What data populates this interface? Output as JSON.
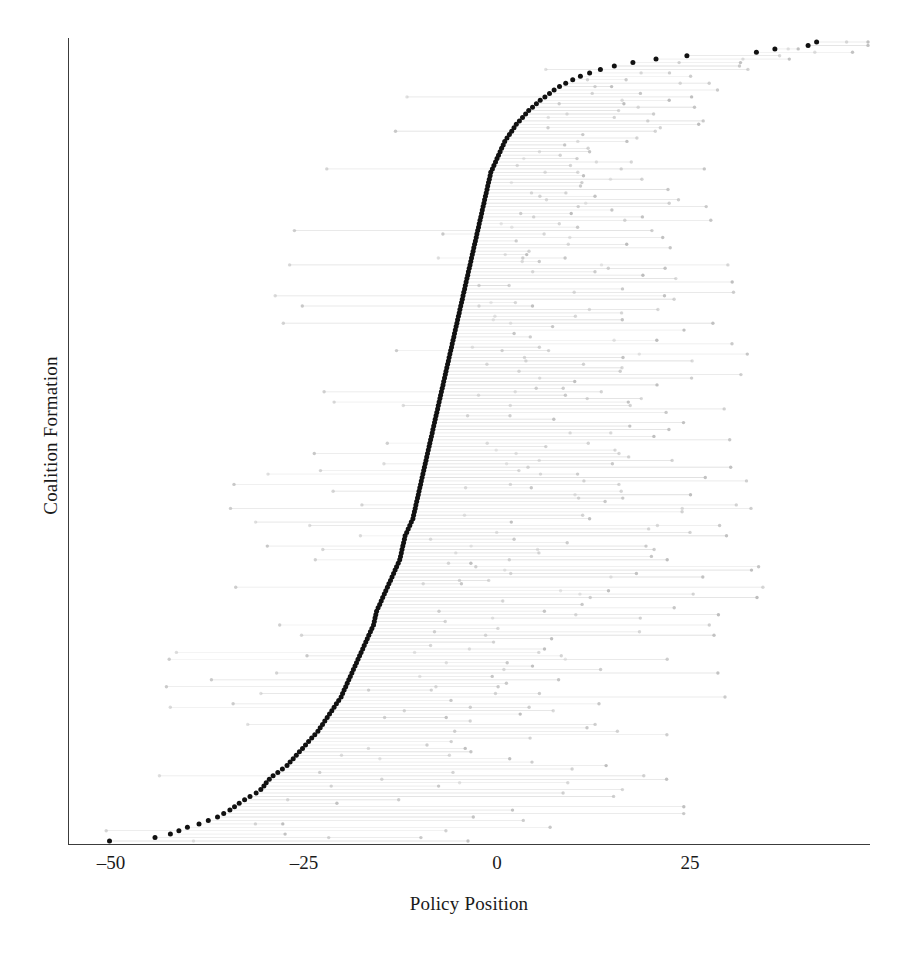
{
  "chart_data": {
    "type": "scatter",
    "title": "",
    "subtitle": "",
    "xlabel": "Policy Position",
    "ylabel": "Coalition Formation",
    "xlim": [
      -53,
      48
    ],
    "ylim": [
      0,
      231
    ],
    "grid": false,
    "legend": null,
    "x_ticks": [
      -50,
      -25,
      0,
      25
    ],
    "x_tick_labels": [
      "–50",
      "–25",
      "0",
      "25"
    ],
    "y_ticks": [],
    "y_tick_labels": [],
    "colors": {
      "point": "#111111",
      "range_line": "#c9c9c9",
      "range_point": "#bdbdbd",
      "axis": "#3c3c3c",
      "text": "#1a1a1a",
      "background": "#ffffff"
    },
    "marker_sizes": {
      "point_radius": 2.5,
      "range_point_radius": 1.7,
      "range_line_width": 0.6
    },
    "series": [
      {
        "name": "Coalition policy position",
        "role": "primary-point",
        "description": "Black dot per coalition formation opportunity, sorted ascending from bottom to top",
        "values": [
          -50.2,
          -44.3,
          -42.3,
          -41.2,
          -40.1,
          -38.6,
          -37.4,
          -36.2,
          -35.4,
          -34.6,
          -34.0,
          -33.4,
          -32.7,
          -32.0,
          -31.2,
          -30.6,
          -30.2,
          -29.9,
          -29.5,
          -29.0,
          -28.4,
          -27.8,
          -27.2,
          -26.8,
          -26.4,
          -26.0,
          -25.6,
          -25.2,
          -24.8,
          -24.4,
          -24.0,
          -23.6,
          -23.2,
          -22.9,
          -22.6,
          -22.3,
          -22.0,
          -21.7,
          -21.4,
          -21.1,
          -20.8,
          -20.5,
          -20.2,
          -20.0,
          -19.8,
          -19.6,
          -19.4,
          -19.2,
          -19.0,
          -18.8,
          -18.6,
          -18.4,
          -18.2,
          -18.0,
          -17.8,
          -17.6,
          -17.4,
          -17.2,
          -17.0,
          -16.8,
          -16.6,
          -16.4,
          -16.2,
          -16.0,
          -15.9,
          -15.8,
          -15.7,
          -15.6,
          -15.4,
          -15.2,
          -15.0,
          -14.8,
          -14.6,
          -14.4,
          -14.2,
          -14.0,
          -13.8,
          -13.6,
          -13.4,
          -13.2,
          -13.0,
          -12.8,
          -12.6,
          -12.5,
          -12.4,
          -12.3,
          -12.2,
          -12.1,
          -12.0,
          -11.9,
          -11.7,
          -11.5,
          -11.3,
          -11.1,
          -10.9,
          -10.8,
          -10.7,
          -10.6,
          -10.5,
          -10.4,
          -10.3,
          -10.2,
          -10.1,
          -10.0,
          -9.9,
          -9.8,
          -9.7,
          -9.6,
          -9.5,
          -9.4,
          -9.3,
          -9.2,
          -9.1,
          -9.0,
          -8.9,
          -8.8,
          -8.7,
          -8.6,
          -8.5,
          -8.4,
          -8.3,
          -8.2,
          -8.1,
          -8.0,
          -7.9,
          -7.8,
          -7.7,
          -7.6,
          -7.5,
          -7.4,
          -7.3,
          -7.2,
          -7.1,
          -7.0,
          -6.9,
          -6.8,
          -6.7,
          -6.6,
          -6.5,
          -6.4,
          -6.3,
          -6.2,
          -6.1,
          -6.0,
          -5.9,
          -5.8,
          -5.7,
          -5.6,
          -5.5,
          -5.4,
          -5.3,
          -5.2,
          -5.1,
          -5.0,
          -4.9,
          -4.8,
          -4.7,
          -4.6,
          -4.5,
          -4.4,
          -4.3,
          -4.2,
          -4.1,
          -4.0,
          -3.9,
          -3.8,
          -3.7,
          -3.6,
          -3.5,
          -3.4,
          -3.3,
          -3.2,
          -3.1,
          -3.0,
          -2.9,
          -2.8,
          -2.7,
          -2.6,
          -2.5,
          -2.4,
          -2.3,
          -2.2,
          -2.1,
          -2.0,
          -1.9,
          -1.8,
          -1.7,
          -1.6,
          -1.5,
          -1.4,
          -1.3,
          -1.2,
          -1.1,
          -1.0,
          -0.9,
          -0.8,
          -0.6,
          -0.4,
          -0.2,
          0.0,
          0.2,
          0.4,
          0.6,
          0.8,
          1.0,
          1.3,
          1.6,
          1.9,
          2.2,
          2.5,
          2.9,
          3.3,
          3.7,
          4.1,
          4.6,
          5.1,
          5.6,
          6.2,
          6.8,
          7.4,
          8.1,
          8.9,
          9.8,
          10.8,
          12.0,
          13.4,
          15.2,
          17.6,
          20.6,
          24.6,
          33.6,
          36.0,
          40.3,
          41.4
        ]
      },
      {
        "name": "Member party position (range endpoint)",
        "role": "range-endpoint",
        "description": "Light gray dot at the right end of each faint horizontal segment; segment spans from the coalition point to this value"
      }
    ]
  },
  "axis": {
    "x_label": "Policy Position",
    "y_label": "Coalition Formation",
    "tick_labels": [
      "–50",
      "–25",
      "0",
      "25"
    ]
  }
}
